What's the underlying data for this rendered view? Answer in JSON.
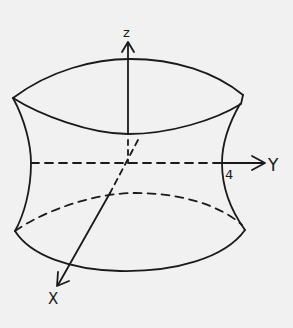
{
  "diagram": {
    "title": "",
    "axes": {
      "z_label": "z",
      "y_label": "Y",
      "x_label": "X"
    },
    "annotations": {
      "radius_label": "4"
    },
    "colors": {
      "background": "#f1f1f1",
      "ink": "#1a1a1a"
    }
  }
}
